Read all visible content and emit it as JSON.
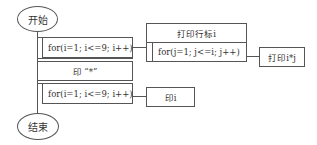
{
  "diagram": {
    "type": "N-S flowchart (nested loops)",
    "start": {
      "label": "开始"
    },
    "end": {
      "label": "结束"
    },
    "outer_block": {
      "loop1": {
        "label": "for(i=1; i<=9; i++)"
      },
      "print_star": {
        "label": "印 “*”"
      },
      "loop2": {
        "label": "for(i=1; i<=9; i++)"
      }
    },
    "loop1_body": {
      "print_row_header": {
        "label": "打印行标i"
      },
      "inner_loop": {
        "label": "for(j=1; j<=i; j++)"
      },
      "inner_body": {
        "label": "打印i*j"
      }
    },
    "loop2_body": {
      "label": "印i"
    },
    "colors": {
      "stroke": "#555555",
      "text": "#333333",
      "background": "#ffffff"
    }
  }
}
